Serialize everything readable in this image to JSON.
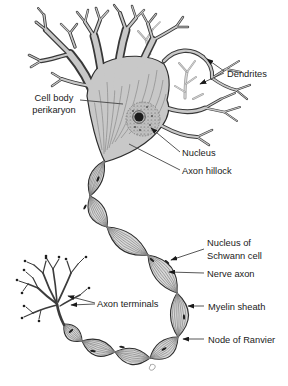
{
  "figure": {
    "type": "labeled-diagram",
    "labels": {
      "dendrites": "Dendrites",
      "cell_body_line1": "Cell body",
      "cell_body_line2": "perikaryon",
      "nucleus": "Nucleus",
      "axon_hillock": "Axon hillock",
      "schwann_line1": "Nucleus of",
      "schwann_line2": "Schwann cell",
      "nerve_axon": "Nerve axon",
      "myelin_sheath": "Myelin sheath",
      "node_of_ranvier": "Node of Ranvier",
      "axon_terminals": "Axon terminals"
    },
    "palette": {
      "ink": "#1a1a1a",
      "outline": "#2e2e2e",
      "branch_outline": "#383838",
      "soma_fill": "#c8c8c8",
      "myelin_fill": "#d8d8d8",
      "light_branch_outline": "#9f9f9f",
      "light_branch_fill": "#d6d6d6",
      "background": "#ffffff"
    }
  }
}
